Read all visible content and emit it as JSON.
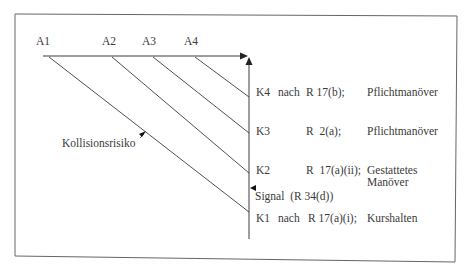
{
  "diagram": {
    "top_labels": [
      {
        "id": "A1",
        "text": "A1",
        "x": 37
      },
      {
        "id": "A2",
        "text": "A2",
        "x": 103
      },
      {
        "id": "A3",
        "text": "A3",
        "x": 143
      },
      {
        "id": "A4",
        "text": "A4",
        "x": 185
      }
    ],
    "collision_label": "Kollisionsrisiko",
    "stages": [
      {
        "id": "K4",
        "stage": "K4",
        "prep": "nach",
        "rule": "R 17(b);",
        "action": "Pflichtmanöver"
      },
      {
        "id": "K3",
        "stage": "K3",
        "prep": "",
        "rule": "R  2(a);",
        "action": "Pflichtmanöver"
      },
      {
        "id": "K2",
        "stage": "K2",
        "prep": "",
        "rule": "R  17(a)(ii);",
        "action": "Gestattetes",
        "action_line2": "Manöver"
      },
      {
        "id": "K1",
        "stage": "K1",
        "prep": "nach",
        "rule": "R 17(a)(i);",
        "action": "Kurshalten"
      }
    ],
    "signal_label": "Signal  (R 34(d))",
    "colors": {
      "line": "#3c3c3c",
      "frame": "#555555",
      "text": "#3a3a3a",
      "background": "#ffffff"
    }
  }
}
